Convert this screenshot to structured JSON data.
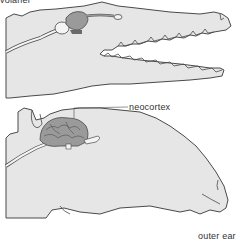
{
  "figure": {
    "top_label": "volaner",
    "labels": {
      "neocortex": "neocortex",
      "outer_ear": "outer ear"
    },
    "panels": [
      {
        "name": "reptile-head",
        "description": "crocodile head with small brain"
      },
      {
        "name": "mammal-head",
        "description": "mammal head with large convoluted brain"
      }
    ],
    "colors": {
      "skin": "#e6e6e6",
      "outline": "#4a4a4a",
      "brain": "#9a9a9a",
      "brain_dark": "#6a6a6a",
      "bulb": "#f4f4f4"
    }
  }
}
